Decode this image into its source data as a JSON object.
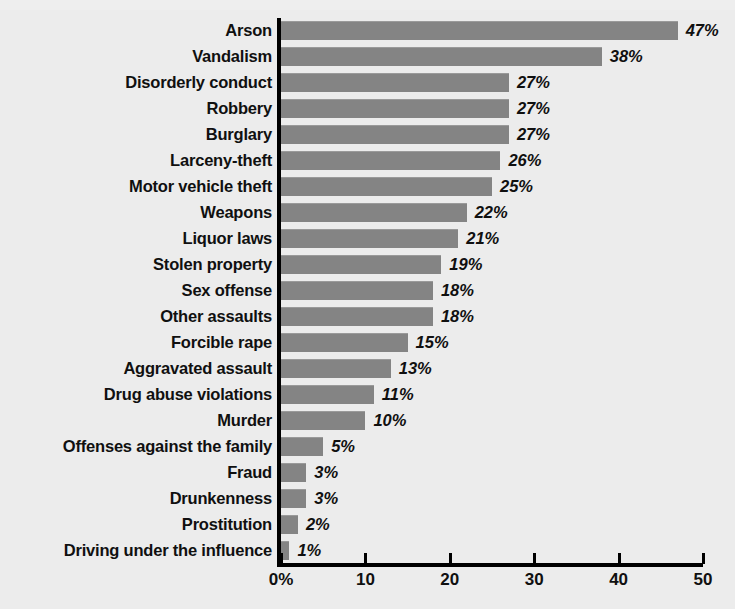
{
  "chart_data": {
    "type": "bar",
    "orientation": "horizontal",
    "title": "",
    "xlabel": "",
    "ylabel": "",
    "xlim": [
      0,
      50
    ],
    "grid": false,
    "legend": null,
    "x_tick_labels": [
      "0%",
      "10",
      "20",
      "30",
      "40",
      "50"
    ],
    "x_ticks": [
      0,
      10,
      20,
      30,
      40,
      50
    ],
    "value_suffix": "%",
    "categories": [
      "Arson",
      "Vandalism",
      "Disorderly conduct",
      "Robbery",
      "Burglary",
      "Larceny-theft",
      "Motor vehicle theft",
      "Weapons",
      "Liquor laws",
      "Stolen property",
      "Sex offense",
      "Other assaults",
      "Forcible rape",
      "Aggravated assault",
      "Drug abuse violations",
      "Murder",
      "Offenses against the family",
      "Fraud",
      "Drunkenness",
      "Prostitution",
      "Driving under the influence"
    ],
    "values": [
      47,
      38,
      27,
      27,
      27,
      26,
      25,
      22,
      21,
      19,
      18,
      18,
      15,
      13,
      11,
      10,
      5,
      3,
      3,
      2,
      1
    ],
    "value_labels": [
      "47%",
      "38%",
      "27%",
      "27%",
      "27%",
      "26%",
      "25%",
      "22%",
      "21%",
      "19%",
      "18%",
      "18%",
      "15%",
      "13%",
      "11%",
      "10%",
      "5%",
      "3%",
      "3%",
      "2%",
      "1%"
    ],
    "colors": {
      "bar": "#848484",
      "background": "#ececec",
      "axis": "#000000",
      "text": "#101010"
    }
  }
}
